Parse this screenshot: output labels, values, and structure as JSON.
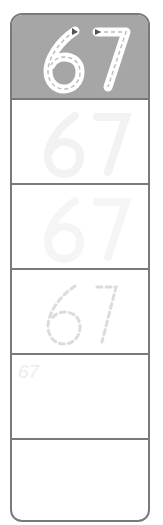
{
  "worksheet": {
    "number": "67",
    "rows": [
      {
        "style": "traced-header",
        "label": "67"
      },
      {
        "style": "faint-solid",
        "label": "67"
      },
      {
        "style": "fainter-solid",
        "label": "67"
      },
      {
        "style": "dashed",
        "label": "67"
      },
      {
        "style": "small-hint",
        "label": "67"
      },
      {
        "style": "blank",
        "label": ""
      }
    ],
    "colors": {
      "header_bg": "#a6a6a6",
      "border": "#7a7a7a"
    }
  }
}
